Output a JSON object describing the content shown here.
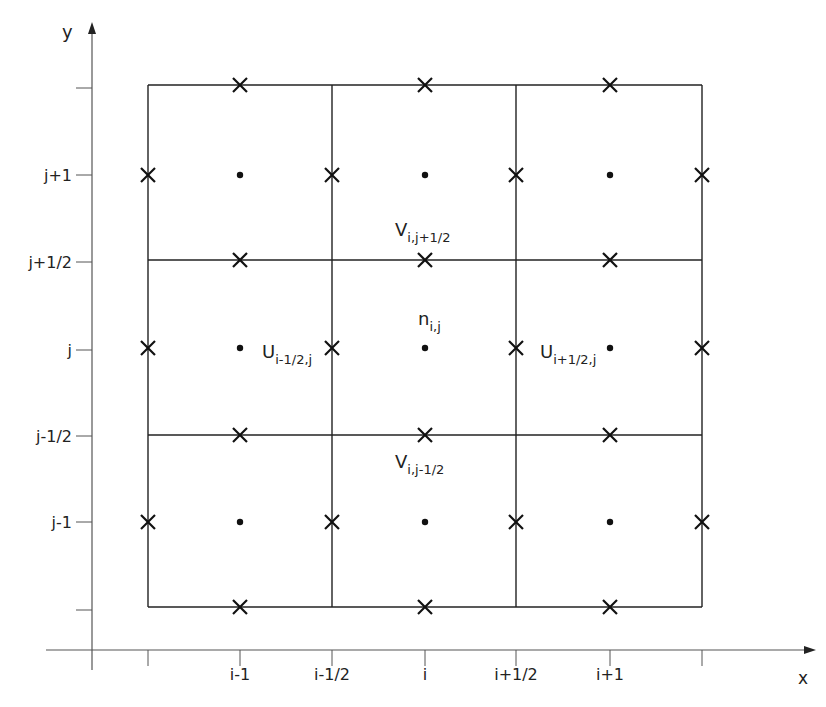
{
  "diagram": {
    "type": "staggered-grid",
    "axes": {
      "x_label": "x",
      "y_label": "y",
      "x_ticks": [
        {
          "label": "",
          "x": 148
        },
        {
          "label": "i-1",
          "x": 240
        },
        {
          "label": "i-1/2",
          "x": 332
        },
        {
          "label": "i",
          "x": 425
        },
        {
          "label": "i+1/2",
          "x": 516
        },
        {
          "label": "i+1",
          "x": 610
        },
        {
          "label": "",
          "x": 702
        }
      ],
      "y_ticks": [
        {
          "label": "",
          "y": 88
        },
        {
          "label": "j+1",
          "y": 175
        },
        {
          "label": "j+1/2",
          "y": 262
        },
        {
          "label": "j",
          "y": 350
        },
        {
          "label": "j-1/2",
          "y": 436
        },
        {
          "label": "j-1",
          "y": 522
        },
        {
          "label": "",
          "y": 610
        }
      ]
    },
    "grid": {
      "x_lines": [
        148,
        332,
        516,
        702
      ],
      "y_lines": [
        85,
        260,
        435,
        607
      ],
      "cell_centers_x": [
        240,
        425,
        610
      ],
      "cell_centers_y": [
        175,
        348,
        522
      ]
    },
    "annotations": [
      {
        "base": "V",
        "sub": "i,j+1/2",
        "x": 395,
        "y": 236
      },
      {
        "base": "n",
        "sub": "i,j",
        "x": 418,
        "y": 325
      },
      {
        "base": "U",
        "sub": "i-1/2,j",
        "x": 262,
        "y": 358
      },
      {
        "base": "U",
        "sub": "i+1/2,j",
        "x": 540,
        "y": 358
      },
      {
        "base": "V",
        "sub": "i,j-1/2",
        "x": 395,
        "y": 468
      }
    ],
    "legend": {
      "dot": "cell-center scalar point",
      "cross": "face-centered velocity point"
    },
    "colors": {
      "line": "#222222",
      "axis": "#555555",
      "text": "#222222"
    }
  }
}
